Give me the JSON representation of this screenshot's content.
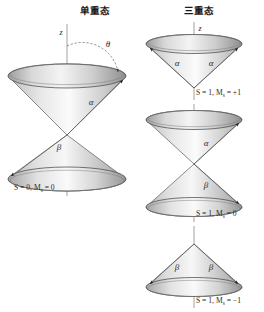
{
  "figure": {
    "width": 264,
    "height": 312,
    "background": "#ffffff",
    "type": "vector-model-spin-diagram"
  },
  "columns": {
    "left": {
      "title": "单重态",
      "title_x": 95,
      "title_y": 14,
      "axis_label": "z",
      "axis_label_x": 98,
      "axis_label_y": 33,
      "angle_label": "θ",
      "angle_label_x": 107,
      "angle_label_y": 47,
      "cone_labels": [
        {
          "text": "α",
          "x": 91,
          "y": 105
        },
        {
          "text": "β",
          "x": 59,
          "y": 147
        }
      ],
      "state_label": "S = 0, M",
      "state_sub": "s",
      "state_tail": " = 0",
      "state_x": 14,
      "state_y": 188
    },
    "right": {
      "title": "三重态",
      "title_x": 199,
      "title_y": 14,
      "axis_label": "z",
      "axis_label_x": 201,
      "axis_label_y": 31,
      "groups": [
        {
          "name": "upper-inverted-cone",
          "labels": [
            {
              "text": "α",
              "x": 177,
              "y": 62
            },
            {
              "text": "α",
              "x": 211,
              "y": 62
            }
          ],
          "state_label": "S = 1, M",
          "state_sub": "s",
          "state_tail": " = +1",
          "state_x": 196,
          "state_y": 94
        },
        {
          "name": "middle-double-cone",
          "labels": [
            {
              "text": "α",
              "x": 204,
              "y": 143
            },
            {
              "text": "β",
              "x": 204,
              "y": 185
            }
          ],
          "state_label": "S = 1, M",
          "state_sub": "s",
          "state_tail": " = 0",
          "state_x": 196,
          "state_y": 215
        },
        {
          "name": "lower-upright-cone",
          "labels": [
            {
              "text": "β",
              "x": 177,
              "y": 266
            },
            {
              "text": "β",
              "x": 211,
              "y": 266
            }
          ],
          "state_label": "S = 1, M",
          "state_sub": "s",
          "state_tail": " = −1",
          "state_x": 196,
          "state_y": 300
        }
      ]
    }
  },
  "colors": {
    "stroke": "#4a4a4a",
    "axis": "#8a8a8a",
    "text": "#2b2b2b",
    "title": "#1a1a1a",
    "cone_light": "#f2f2f2",
    "cone_mid": "#cfcfcf",
    "cone_dark": "#a8a8a8",
    "background": "#ffffff"
  }
}
